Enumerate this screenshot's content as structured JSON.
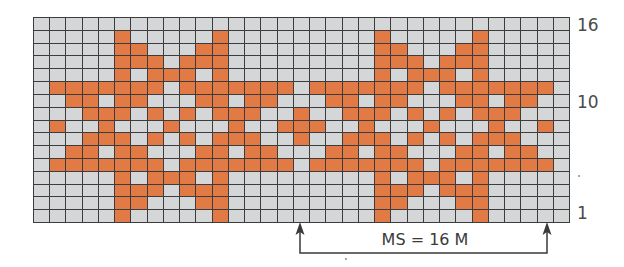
{
  "chart_data": {
    "type": "table",
    "columns": 33,
    "rows": 16,
    "row_labels": [
      {
        "row": 16,
        "label": "16"
      },
      {
        "row": 10,
        "label": "10"
      },
      {
        "row": 1,
        "label": "1"
      }
    ],
    "colors": {
      "background_stitch": "#d4d6d7",
      "contrast_stitch": "#e27a45",
      "grid_line": "#3c3c3c"
    },
    "filled_cells_by_row": {
      "16": [],
      "15": [
        5,
        11,
        21,
        27
      ],
      "14": [
        5,
        6,
        10,
        11,
        21,
        22,
        26,
        27
      ],
      "13": [
        5,
        6,
        7,
        9,
        10,
        11,
        21,
        22,
        23,
        25,
        26,
        27
      ],
      "12": [
        5,
        7,
        8,
        9,
        11,
        21,
        23,
        24,
        25,
        27
      ],
      "11": [
        1,
        2,
        3,
        4,
        5,
        6,
        7,
        9,
        10,
        11,
        12,
        13,
        14,
        15,
        17,
        18,
        19,
        20,
        21,
        22,
        23,
        25,
        26,
        27,
        28,
        29,
        30,
        31
      ],
      "10": [
        2,
        3,
        5,
        6,
        10,
        11,
        13,
        14,
        18,
        19,
        21,
        22,
        26,
        27,
        29,
        30
      ],
      "9": [
        3,
        4,
        5,
        7,
        9,
        11,
        12,
        13,
        16,
        19,
        20,
        21,
        23,
        25,
        27,
        28,
        29
      ],
      "8": [
        1,
        4,
        8,
        12,
        15,
        16,
        17,
        20,
        24,
        28,
        31
      ],
      "7": [
        3,
        4,
        5,
        7,
        9,
        11,
        12,
        13,
        16,
        19,
        20,
        21,
        23,
        25,
        27,
        28,
        29
      ],
      "6": [
        2,
        3,
        5,
        6,
        10,
        11,
        13,
        14,
        18,
        19,
        21,
        22,
        26,
        27,
        29,
        30
      ],
      "5": [
        1,
        2,
        3,
        4,
        5,
        6,
        7,
        9,
        10,
        11,
        12,
        13,
        14,
        15,
        17,
        18,
        19,
        20,
        21,
        22,
        23,
        25,
        26,
        27,
        28,
        29,
        30,
        31
      ],
      "4": [
        5,
        7,
        8,
        9,
        11,
        21,
        23,
        24,
        25,
        27
      ],
      "3": [
        5,
        6,
        7,
        9,
        10,
        11,
        21,
        22,
        23,
        25,
        26,
        27
      ],
      "2": [
        5,
        6,
        10,
        11,
        21,
        22,
        26,
        27
      ],
      "1": [
        5,
        11,
        21,
        27
      ]
    },
    "repeat": {
      "label": "MS = 16 M",
      "start_col": 16,
      "end_col": 31,
      "stitches": 16
    },
    "legend": []
  },
  "labels": {
    "row_16": "16",
    "row_10": "10",
    "row_1": "1",
    "repeat": "MS = 16 M"
  }
}
